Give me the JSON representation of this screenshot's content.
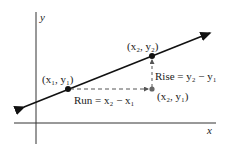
{
  "axes": {
    "x_label": "x",
    "y_label": "y"
  },
  "points": {
    "p1": "(x₁, y₁)",
    "p2": "(x₂, y₂)",
    "p3": "(x₂, y₁)"
  },
  "annotations": {
    "run": "Run = x₂ − x₁",
    "rise": "Rise = y₂ − y₁"
  },
  "colors": {
    "line": "#111111",
    "dashed": "#555555",
    "point3": "#666666"
  }
}
